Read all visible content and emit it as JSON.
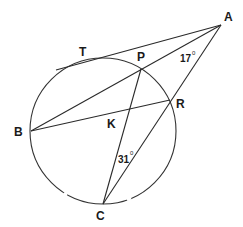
{
  "diagram": {
    "type": "geometry",
    "circle": {
      "cx": 103,
      "cy": 131,
      "r": 73
    },
    "points": {
      "A": {
        "label": "A",
        "x": 221,
        "y": 25
      },
      "T": {
        "label": "T",
        "x": 97,
        "y": 58
      },
      "P": {
        "label": "P",
        "x": 141,
        "y": 69
      },
      "R": {
        "label": "R",
        "x": 170,
        "y": 100
      },
      "B": {
        "label": "B",
        "x": 31,
        "y": 131
      },
      "K": {
        "label": "K",
        "x": 127,
        "y": 111
      },
      "C": {
        "label": "C",
        "x": 103,
        "y": 204
      }
    },
    "segments": [
      {
        "from": "tangent-start",
        "to": "A",
        "x1": 56,
        "y1": 70,
        "x2": 221,
        "y2": 25
      },
      {
        "from": "A",
        "to": "B",
        "x1": 221,
        "y1": 25,
        "x2": 31,
        "y2": 131
      },
      {
        "from": "A",
        "to": "C",
        "x1": 221,
        "y1": 25,
        "x2": 103,
        "y2": 204
      },
      {
        "from": "B",
        "to": "R",
        "x1": 31,
        "y1": 131,
        "x2": 170,
        "y2": 100
      },
      {
        "from": "P",
        "to": "C",
        "x1": 141,
        "y1": 69,
        "x2": 103,
        "y2": 204
      }
    ],
    "angles": {
      "A": {
        "value": "17",
        "unit": "0"
      },
      "C": {
        "value": "31",
        "unit": "0"
      }
    }
  }
}
